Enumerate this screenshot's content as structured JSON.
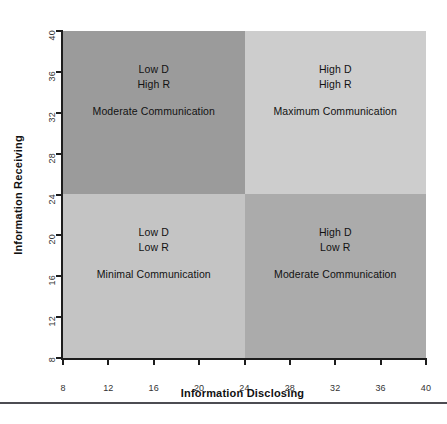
{
  "chart_data": {
    "type": "scatter",
    "title": "",
    "xlabel": "Information Disclosing",
    "ylabel": "Information Receiving",
    "xlim": [
      8,
      40
    ],
    "ylim": [
      8,
      40
    ],
    "xticks": [
      8,
      12,
      16,
      20,
      24,
      28,
      32,
      36,
      40
    ],
    "yticks": [
      8,
      12,
      16,
      20,
      24,
      28,
      32,
      36,
      40
    ],
    "grid": false,
    "legend": null,
    "split_x": 24,
    "split_y": 24,
    "quadrants": [
      {
        "id": "top-left",
        "line1": "Low D",
        "line2": "High R",
        "description": "Moderate Communication",
        "x_range": [
          8,
          24
        ],
        "y_range": [
          24,
          40
        ],
        "color": "#9b9b9b"
      },
      {
        "id": "top-right",
        "line1": "High D",
        "line2": "High R",
        "description": "Maximum Communication",
        "x_range": [
          24,
          40
        ],
        "y_range": [
          24,
          40
        ],
        "color": "#cdcdcd"
      },
      {
        "id": "bottom-left",
        "line1": "Low D",
        "line2": "Low R",
        "description": "Minimal Communication",
        "x_range": [
          8,
          24
        ],
        "y_range": [
          8,
          24
        ],
        "color": "#c4c4c4"
      },
      {
        "id": "bottom-right",
        "line1": "High D",
        "line2": "Low R",
        "description": "Moderate Communication",
        "x_range": [
          24,
          40
        ],
        "y_range": [
          8,
          24
        ],
        "color": "#ababab"
      }
    ]
  },
  "axes": {
    "x": {
      "title": "Information Disclosing",
      "tick_labels": [
        "8",
        "12",
        "16",
        "20",
        "24",
        "28",
        "32",
        "36",
        "40"
      ]
    },
    "y": {
      "title": "Information Receiving",
      "tick_labels": [
        "8",
        "12",
        "16",
        "20",
        "24",
        "28",
        "32",
        "36",
        "40"
      ]
    }
  },
  "colors": {
    "axis_line": "#1d1d1d",
    "text": "#121212",
    "footer_rule": "#4c4c52",
    "background": "#ffffff"
  }
}
